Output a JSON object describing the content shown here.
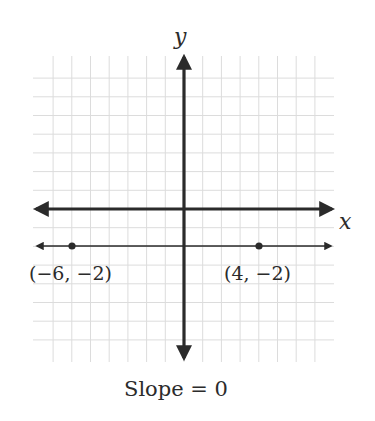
{
  "chart_data": {
    "type": "line",
    "title": "",
    "xlabel": "x",
    "ylabel": "y",
    "grid": true,
    "xlim": [
      -8,
      8
    ],
    "ylim": [
      -8,
      7
    ],
    "series": [
      {
        "name": "horizontal line y = -2",
        "equation": "y = -2",
        "points": [
          {
            "x": -6,
            "y": -2,
            "label": "(−6, −2)"
          },
          {
            "x": 4,
            "y": -2,
            "label": "(4, −2)"
          }
        ]
      }
    ],
    "annotations": [
      "Slope = 0"
    ]
  },
  "labels": {
    "x_axis": "x",
    "y_axis": "y",
    "point_a": "(−6, −2)",
    "point_b": "(4, −2)",
    "caption": "Slope = 0"
  },
  "colors": {
    "axis": "#2b2b2b",
    "grid": "#dcdcdc",
    "line": "#2b2b2b",
    "point": "#2b2b2b"
  }
}
